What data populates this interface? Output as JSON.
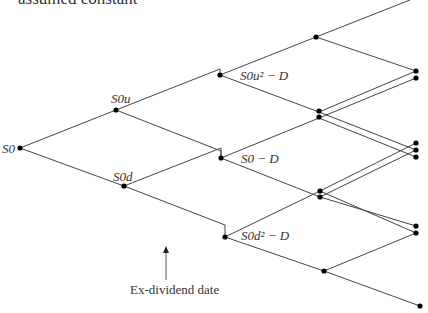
{
  "title_fragment": "assumed constant",
  "labels": {
    "root": "S0",
    "up": "S0u",
    "down": "S0d",
    "exdiv_up": "S0u² − D",
    "exdiv_mid": "S0 − D",
    "exdiv_down": "S0d² − D",
    "annotation": "Ex-dividend date"
  },
  "colors": {
    "line": "#444444",
    "node": "#000000",
    "text": "#333333"
  }
}
